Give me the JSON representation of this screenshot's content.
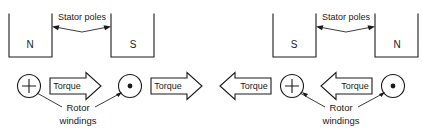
{
  "figure": {
    "ink_color": "#1a1a1a",
    "background_color": "#ffffff"
  },
  "labels": {
    "stator_poles": "Stator poles",
    "rotor_windings_line1": "Rotor",
    "rotor_windings_line2": "windings",
    "torque": "Torque",
    "pole_north": "N",
    "pole_south": "S"
  },
  "diagrams": [
    {
      "id": "left",
      "name": "initial-position",
      "poles": [
        {
          "id": "left-pole",
          "label": "N",
          "side": "left"
        },
        {
          "id": "right-pole",
          "label": "S",
          "side": "right"
        }
      ],
      "stator_label": "Stator poles",
      "rotor_conductors": [
        {
          "id": "plus-conductor",
          "symbol": "plus",
          "meaning": "current-into-page"
        },
        {
          "id": "dot-conductor",
          "symbol": "dot",
          "meaning": "current-out-of-page"
        }
      ],
      "torque_arrows": [
        {
          "id": "torque-arrow-1",
          "label": "Torque",
          "direction": "right"
        },
        {
          "id": "torque-arrow-2",
          "label": "Torque",
          "direction": "right"
        }
      ],
      "rotor_label_line1": "Rotor",
      "rotor_label_line2": "windings"
    },
    {
      "id": "right",
      "name": "reversed-position",
      "poles": [
        {
          "id": "left-pole",
          "label": "S",
          "side": "left"
        },
        {
          "id": "right-pole",
          "label": "N",
          "side": "right"
        }
      ],
      "stator_label": "Stator poles",
      "rotor_conductors": [
        {
          "id": "plus-conductor",
          "symbol": "plus",
          "meaning": "current-into-page"
        },
        {
          "id": "dot-conductor",
          "symbol": "dot",
          "meaning": "current-out-of-page"
        }
      ],
      "torque_arrows": [
        {
          "id": "torque-arrow-1",
          "label": "Torque",
          "direction": "left"
        },
        {
          "id": "torque-arrow-2",
          "label": "Torque",
          "direction": "left"
        }
      ],
      "rotor_label_line1": "Rotor",
      "rotor_label_line2": "windings"
    }
  ]
}
